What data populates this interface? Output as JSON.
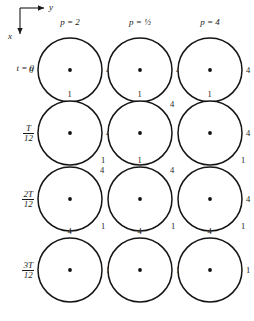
{
  "figure": {
    "axis_key": {
      "y_label": "y",
      "x_label": "x",
      "y_direction": "right",
      "x_direction": "down"
    },
    "columns": [
      {
        "id": "p2",
        "header": "p  =  2"
      },
      {
        "id": "phalf",
        "header": "p  =  ½"
      },
      {
        "id": "p4",
        "header": "p  =  4"
      }
    ],
    "rows": [
      {
        "id": "t0",
        "label_plain": "t = 0",
        "label_kind": "equation",
        "numerator": "",
        "denominator": ""
      },
      {
        "id": "t1",
        "label_plain": "T/12",
        "label_kind": "fraction",
        "numerator": "T",
        "denominator": "12"
      },
      {
        "id": "t2",
        "label_plain": "2T/12",
        "label_kind": "fraction",
        "numerator": "2T",
        "denominator": "12"
      },
      {
        "id": "t3",
        "label_plain": "3T/12",
        "label_kind": "fraction",
        "numerator": "3T",
        "denominator": "12"
      }
    ],
    "dial_labels": {
      "zero": "0",
      "four": "4",
      "one": "1"
    }
  },
  "chart_data": {
    "type": "scatter",
    "xlabel": "y (horizontal, positive right)",
    "ylabel": "x (vertical, positive down)",
    "grid": false,
    "legend": null,
    "panel_radius_px": 32,
    "spoke_count": 12,
    "angle_unit": "degrees_clockwise_from_right",
    "panels": [
      {
        "row": "t = 0",
        "column": "p = 2",
        "tick_labels": [
          {
            "text": "0",
            "position": "left"
          },
          {
            "text": "4",
            "position": "right"
          },
          {
            "text": "1",
            "position": "bottom"
          }
        ],
        "spoke_angles": [
          0,
          30,
          60,
          90,
          120,
          150,
          180,
          210,
          240,
          270,
          300,
          330
        ],
        "emphasised": [
          0,
          90,
          180,
          270
        ]
      },
      {
        "row": "t = 0",
        "column": "p = 1/2",
        "tick_labels": [
          {
            "text": "4",
            "position": "right"
          },
          {
            "text": "1",
            "position": "bottom"
          }
        ],
        "spoke_angles": [
          0,
          30,
          60,
          90,
          120,
          150,
          180,
          210,
          240,
          270,
          300,
          330
        ],
        "emphasised": [
          0,
          90,
          180,
          270
        ]
      },
      {
        "row": "t = 0",
        "column": "p = 4",
        "tick_labels": [
          {
            "text": "4",
            "position": "right"
          },
          {
            "text": "1",
            "position": "bottom"
          }
        ],
        "spoke_angles": [
          0,
          30,
          60,
          90,
          120,
          150,
          180,
          210,
          240,
          270,
          300,
          330
        ],
        "emphasised": [
          0,
          90,
          180,
          270
        ]
      },
      {
        "row": "T/12",
        "column": "p = 2",
        "tick_labels": [
          {
            "text": "1",
            "position": "top"
          },
          {
            "text": "4",
            "position": "right"
          },
          {
            "text": "1",
            "position": "bottom-right"
          }
        ],
        "spoke_angles": [
          10,
          34,
          62,
          96,
          124,
          150,
          190,
          214,
          242,
          276,
          304,
          330
        ],
        "emphasised": [
          10,
          96,
          190,
          276
        ]
      },
      {
        "row": "T/12",
        "column": "p = 1/2",
        "tick_labels": [
          {
            "text": "1",
            "position": "top"
          },
          {
            "text": "4",
            "position": "top-right"
          },
          {
            "text": "1",
            "position": "bottom"
          }
        ],
        "spoke_angles": [
          330,
          344,
          356,
          8,
          20,
          34,
          62,
          96,
          150,
          190,
          242,
          286
        ],
        "emphasised": [
          330,
          8,
          150,
          242
        ]
      },
      {
        "row": "T/12",
        "column": "p = 4",
        "tick_labels": [
          {
            "text": "1",
            "position": "top"
          },
          {
            "text": "4",
            "position": "right"
          },
          {
            "text": "1",
            "position": "bottom-right"
          }
        ],
        "spoke_angles": [
          352,
          358,
          4,
          10,
          16,
          172,
          178,
          184,
          190,
          196,
          110,
          290
        ],
        "emphasised": [
          4,
          184,
          110,
          290
        ]
      },
      {
        "row": "2T/12",
        "column": "p = 2",
        "tick_labels": [
          {
            "text": "4",
            "position": "top-right"
          },
          {
            "text": "1",
            "position": "bottom-right"
          }
        ],
        "spoke_angles": [
          350,
          358,
          6,
          16,
          28,
          56,
          170,
          178,
          186,
          196,
          208,
          236
        ],
        "emphasised": [
          6,
          186,
          56,
          236
        ]
      },
      {
        "row": "2T/12",
        "column": "p = 1/2",
        "tick_labels": [
          {
            "text": "1",
            "position": "top"
          },
          {
            "text": "4",
            "position": "top-right"
          },
          {
            "text": "1",
            "position": "bottom-right"
          }
        ],
        "spoke_angles": [
          262,
          270,
          278,
          286,
          296,
          308,
          82,
          90,
          98,
          106,
          116,
          128
        ],
        "emphasised": [
          278,
          98,
          308,
          128
        ]
      },
      {
        "row": "2T/12",
        "column": "p = 4",
        "tick_labels": [
          {
            "text": "4",
            "position": "right"
          },
          {
            "text": "1",
            "position": "bottom-right"
          }
        ],
        "spoke_angles": [
          348,
          356,
          2,
          8,
          14,
          20,
          168,
          176,
          182,
          188,
          194,
          200
        ],
        "emphasised": [
          2,
          182,
          14,
          194
        ]
      },
      {
        "row": "3T/12",
        "column": "p = 2",
        "tick_labels": [
          {
            "text": "4",
            "position": "top"
          },
          {
            "text": "1",
            "position": "right"
          }
        ],
        "spoke_angles": [
          348,
          354,
          0,
          6,
          12,
          20,
          168,
          174,
          180,
          186,
          192,
          200
        ],
        "emphasised": [
          0,
          180,
          90,
          270
        ]
      },
      {
        "row": "3T/12",
        "column": "p = 1/2",
        "tick_labels": [
          {
            "text": "4",
            "position": "top"
          },
          {
            "text": "1",
            "position": "right"
          }
        ],
        "spoke_angles": [
          262,
          270,
          276,
          282,
          290,
          300,
          82,
          90,
          96,
          102,
          110,
          120
        ],
        "emphasised": [
          270,
          90,
          0,
          180
        ]
      },
      {
        "row": "3T/12",
        "column": "p = 4",
        "tick_labels": [
          {
            "text": "4",
            "position": "top"
          },
          {
            "text": "1",
            "position": "right"
          }
        ],
        "spoke_angles": [
          354,
          357,
          0,
          3,
          6,
          9,
          174,
          177,
          180,
          183,
          186,
          189
        ],
        "emphasised": [
          0,
          180,
          90,
          270
        ]
      }
    ]
  },
  "layout": {
    "panel_centers_x": [
      70,
      140,
      210
    ],
    "panel_centers_y": [
      70,
      133,
      199,
      270
    ],
    "radius": 32,
    "header_y": 18,
    "row_label_x": 24
  }
}
